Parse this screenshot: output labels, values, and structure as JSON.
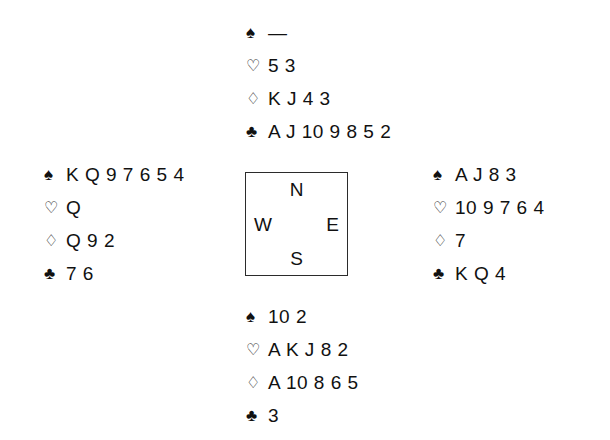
{
  "diagram": {
    "type": "bridge-deal-diagram",
    "suit_symbols": {
      "spades": "♠",
      "hearts": "♡",
      "diamonds": "♢",
      "clubs": "♣"
    },
    "void_marker": "—",
    "compass": {
      "north": "N",
      "east": "E",
      "south": "S",
      "west": "W"
    },
    "hands": {
      "north": {
        "spades": "—",
        "hearts": "5 3",
        "diamonds": "K J 4 3",
        "clubs": "A J 10 9 8 5 2"
      },
      "west": {
        "spades": "K Q 9 7 6 5 4",
        "hearts": "Q",
        "diamonds": "Q 9 2",
        "clubs": "7 6"
      },
      "east": {
        "spades": "A J 8 3",
        "hearts": "10 9 7 6 4",
        "diamonds": "7",
        "clubs": "K Q 4"
      },
      "south": {
        "spades": "10 2",
        "hearts": "A K J 8 2",
        "diamonds": "A 10 8 6 5",
        "clubs": "3"
      }
    }
  }
}
